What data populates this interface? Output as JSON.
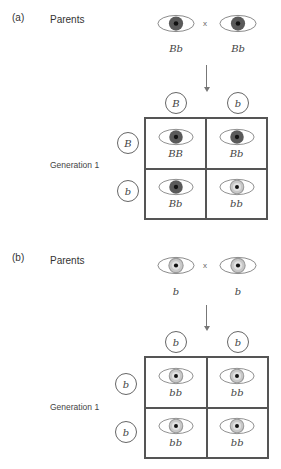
{
  "colors": {
    "brown_iris": "#5a5a5a",
    "blue_iris": "#c8c8c8",
    "blue_iris_ring": "#9a9a9a",
    "pupil": "#111111",
    "outline": "#777777"
  },
  "panels": [
    {
      "label": "(a)",
      "parents_label": "Parents",
      "cross_symbol": "x",
      "parents": [
        {
          "genotype": "Bb",
          "eye": "brown-eye-icon"
        },
        {
          "genotype": "Bb",
          "eye": "brown-eye-icon"
        }
      ],
      "column_alleles": [
        "B",
        "b"
      ],
      "row_alleles": [
        "B",
        "b"
      ],
      "generation_label": "Generation 1",
      "cells": [
        {
          "genotype": "BB",
          "eye": "brown-eye-icon"
        },
        {
          "genotype": "Bb",
          "eye": "brown-eye-icon"
        },
        {
          "genotype": "Bb",
          "eye": "brown-eye-icon"
        },
        {
          "genotype": "bb",
          "eye": "blue-eye-icon"
        }
      ]
    },
    {
      "label": "(b)",
      "parents_label": "Parents",
      "cross_symbol": "x",
      "parents": [
        {
          "genotype": "b",
          "eye": "blue-eye-icon"
        },
        {
          "genotype": "b",
          "eye": "blue-eye-icon"
        }
      ],
      "column_alleles": [
        "b",
        "b"
      ],
      "row_alleles": [
        "b",
        "b"
      ],
      "generation_label": "Generation 1",
      "cells": [
        {
          "genotype": "bb",
          "eye": "blue-eye-icon"
        },
        {
          "genotype": "bb",
          "eye": "blue-eye-icon"
        },
        {
          "genotype": "bb",
          "eye": "blue-eye-icon"
        },
        {
          "genotype": "bb",
          "eye": "blue-eye-icon"
        }
      ]
    }
  ]
}
